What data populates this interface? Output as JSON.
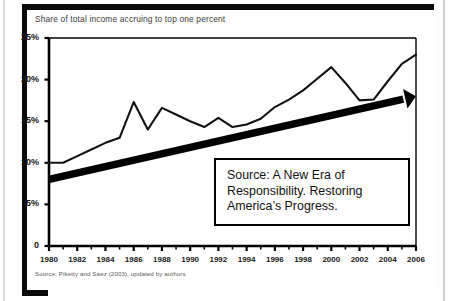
{
  "figure": {
    "title": "Share of total income accruing to top one percent",
    "source_note": "Source: Piketty and Saez (2003), updated by authors.",
    "callout": {
      "lines": [
        "Source: A New Era of",
        "Responsibility. Restoring",
        "America’s Progress."
      ]
    },
    "colors": {
      "ink": "#000000",
      "line": "#111111",
      "trend_arrow": "#000000",
      "background": "#ffffff"
    }
  },
  "chart_data": {
    "type": "line",
    "title": "Share of total income accruing to top one percent",
    "xlabel": "",
    "ylabel": "",
    "xlim": [
      1980,
      2006
    ],
    "ylim": [
      0,
      25
    ],
    "grid": false,
    "legend": "none",
    "ytick_labels": [
      "25%",
      "20%",
      "15%",
      "10%",
      "5%",
      "0"
    ],
    "ytick_values": [
      25,
      20,
      15,
      10,
      5,
      0
    ],
    "xtick_labels": [
      "1980",
      "1982",
      "1984",
      "1986",
      "1988",
      "1990",
      "1992",
      "1994",
      "1996",
      "1998",
      "2000",
      "2002",
      "2004",
      "2006"
    ],
    "xtick_values": [
      1980,
      1982,
      1984,
      1986,
      1988,
      1990,
      1992,
      1994,
      1996,
      1998,
      2000,
      2002,
      2004,
      2006
    ],
    "x": [
      1980,
      1981,
      1982,
      1983,
      1984,
      1985,
      1986,
      1987,
      1988,
      1989,
      1990,
      1991,
      1992,
      1993,
      1994,
      1995,
      1996,
      1997,
      1998,
      1999,
      2000,
      2001,
      2002,
      2003,
      2004,
      2005,
      2006
    ],
    "values": [
      10.0,
      10.0,
      10.8,
      11.6,
      12.4,
      13.0,
      17.3,
      14.0,
      16.6,
      15.8,
      15.0,
      14.3,
      15.4,
      14.3,
      14.6,
      15.3,
      16.7,
      17.6,
      18.7,
      20.1,
      21.5,
      19.6,
      17.5,
      17.6,
      19.8,
      21.9,
      23.0
    ],
    "annotations": [
      {
        "type": "trend-arrow",
        "from": [
          1980,
          8.0
        ],
        "to": [
          2006,
          18.0
        ],
        "style": "thick-black-arrow"
      },
      {
        "type": "text-box",
        "text": "Source: A New Era of Responsibility. Restoring America’s Progress."
      }
    ]
  }
}
